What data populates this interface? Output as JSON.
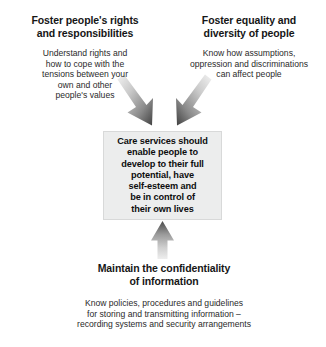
{
  "diagram": {
    "center": {
      "text": "Care services should\nenable people to\ndevelop to their full\npotential, have\nself-esteem and\nbe in control of\ntheir own lives",
      "fill_color": "#eceded",
      "border_color": "#d8d9d9"
    },
    "nodes": [
      {
        "id": "rights",
        "title": "Foster people's rights\nand responsibilities",
        "body": "Understand rights and\nhow to cope with the\ntensions between your\nown and other\npeople's values",
        "position": "top-left"
      },
      {
        "id": "equality",
        "title": "Foster equality and\ndiversity of people",
        "body": "Know how assumptions,\noppression and discriminations\ncan affect people",
        "position": "top-right"
      },
      {
        "id": "confidentiality",
        "title": "Maintain the confidentiality\nof information",
        "body": "Know policies, procedures and guidelines\nfor storing and transmitting information –\nrecording systems and security arrangements",
        "position": "bottom-center"
      }
    ],
    "arrows": [
      {
        "id": "arrow-rights-to-center",
        "from": "rights",
        "to": "center",
        "direction": "down-right",
        "style": "gradient-gray"
      },
      {
        "id": "arrow-equality-to-center",
        "from": "equality",
        "to": "center",
        "direction": "down-left",
        "style": "gradient-gray"
      },
      {
        "id": "arrow-confidentiality-to-center",
        "from": "confidentiality",
        "to": "center",
        "direction": "up",
        "style": "gradient-gray"
      }
    ],
    "colors": {
      "arrow_dark": "#4f4f4f",
      "arrow_light": "#e3e3e3",
      "text": "#161616",
      "background": "#ffffff"
    }
  }
}
